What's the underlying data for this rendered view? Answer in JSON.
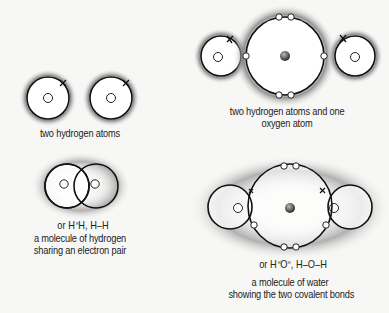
{
  "panels": {
    "two_hydrogen_atoms": {
      "caption": "two hydrogen atoms"
    },
    "hydrogen_oxygen_atoms": {
      "caption_line1": "two hydrogen atoms and one",
      "caption_line2": "oxygen atom"
    },
    "hydrogen_molecule": {
      "formula_prefix": "or H",
      "formula_dots": "×\n•",
      "formula_suffix": "H, H–H",
      "caption_line1": "a molecule of hydrogen",
      "caption_line2": "sharing an electron pair"
    },
    "water_molecule": {
      "formula_prefix": "or H",
      "formula_center": "O",
      "formula_suffix": ", H–O–H",
      "caption_line1": "a molecule of water",
      "caption_line2": "showing the two covalent bonds"
    }
  },
  "colors": {
    "background": "#f7f7f5",
    "orbit": "#111111",
    "glow": "#8a8a8a",
    "nucleus_oxygen": "#555555",
    "text": "#222222"
  }
}
